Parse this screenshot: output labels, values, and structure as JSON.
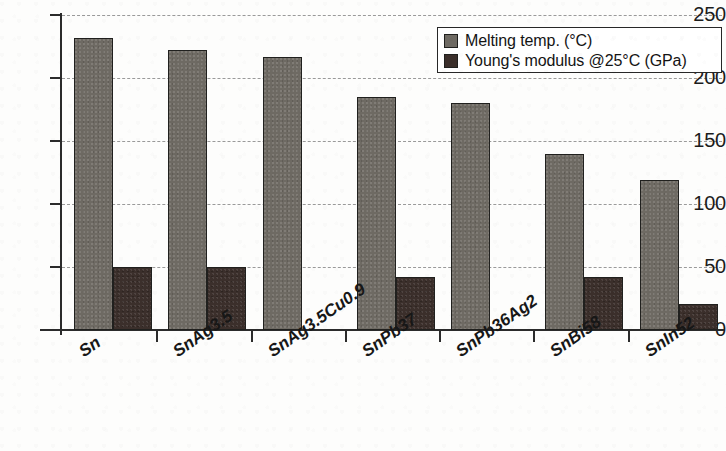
{
  "chart_data": {
    "type": "bar",
    "title": "",
    "xlabel": "",
    "ylabel": "",
    "ylim": [
      0,
      250
    ],
    "yticks": [
      0,
      50,
      100,
      150,
      200,
      250
    ],
    "grid": true,
    "legend_position": "top-right",
    "categories": [
      "Sn",
      "SnAg3.5",
      "SnAg3.5Cu0.9",
      "SnPb37",
      "SnPb36Ag2",
      "SnBi58",
      "SnIn52"
    ],
    "series": [
      {
        "name": "Melting temp. (°C)",
        "color": "#6e6a63",
        "values": [
          232,
          222,
          217,
          185,
          180,
          140,
          119
        ]
      },
      {
        "name": "Young's modulus @25°C (GPa)",
        "color": "#3b2f2b",
        "values": [
          50,
          50,
          null,
          42,
          null,
          42,
          21
        ]
      }
    ]
  },
  "legend": {
    "items": [
      {
        "label": "Melting temp. (°C)",
        "swatch": "melt"
      },
      {
        "label": "Young's modulus @25°C (GPa)",
        "swatch": "mod"
      }
    ]
  },
  "axis": {
    "y_tick_labels": [
      "250",
      "200",
      "150",
      "100",
      "50",
      "0"
    ]
  }
}
